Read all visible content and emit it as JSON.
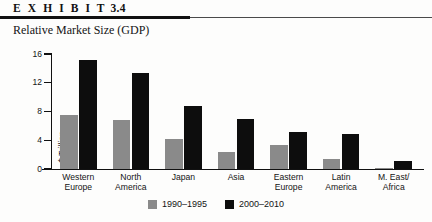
{
  "exhibit": {
    "label": "E X H I B I T",
    "number": "3.4"
  },
  "subtitle": "Relative Market Size (GDP)",
  "colors": {
    "series_1990_1995": "#8a8a8a",
    "series_2000_2010": "#0d0d0d",
    "rule": "#111111",
    "text": "#141414"
  },
  "chart_data": {
    "type": "bar",
    "title": "Relative Market Size (GDP)",
    "xlabel": "",
    "ylabel": "$ Trillion",
    "ylim": [
      0,
      16
    ],
    "yticks": [
      0,
      4,
      8,
      12,
      16
    ],
    "ytick_labels": [
      "0",
      "4",
      "8",
      "12",
      "16"
    ],
    "grid": false,
    "legend_position": "bottom-center",
    "categories": [
      "Western Europe",
      "North America",
      "Japan",
      "Asia",
      "Eastern Europe",
      "Latin America",
      "M. East/ Africa"
    ],
    "category_lines": [
      [
        "Western",
        "Europe"
      ],
      [
        "North",
        "America"
      ],
      [
        "Japan",
        ""
      ],
      [
        "Asia",
        ""
      ],
      [
        "Eastern",
        "Europe"
      ],
      [
        "Latin",
        "America"
      ],
      [
        "M. East/",
        "Africa"
      ]
    ],
    "series": [
      {
        "name": "1990–1995",
        "color": "#8a8a8a",
        "values": [
          7.5,
          6.8,
          4.2,
          2.4,
          3.3,
          1.4,
          0.2
        ]
      },
      {
        "name": "2000–2010",
        "color": "#0d0d0d",
        "values": [
          15.1,
          13.4,
          8.8,
          7.0,
          5.1,
          4.9,
          1.1
        ]
      }
    ]
  }
}
